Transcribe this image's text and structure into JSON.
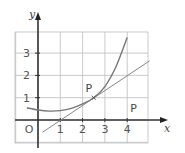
{
  "chart_data": {
    "type": "line",
    "title": "",
    "xlabel": "x",
    "ylabel": "y",
    "xlim": [
      -1,
      5
    ],
    "ylim": [
      -1,
      4
    ],
    "grid": true,
    "x_ticks": [
      "1",
      "2",
      "3",
      "4"
    ],
    "y_ticks": [
      "1",
      "2",
      "3"
    ],
    "origin_label": "O",
    "series": [
      {
        "name": "curve",
        "x": [
          -0.5,
          0,
          0.5,
          1,
          1.5,
          2,
          2.5,
          3,
          3.5,
          4
        ],
        "y": [
          0.55,
          0.45,
          0.4,
          0.42,
          0.52,
          0.72,
          1.0,
          1.5,
          2.4,
          3.7
        ]
      },
      {
        "name": "tangent",
        "x": [
          0.2,
          5.0
        ],
        "y": [
          -0.55,
          2.65
        ]
      }
    ],
    "annotations": [
      {
        "label": "P",
        "x": 2.5,
        "y": 1.0,
        "note": "point of tangency"
      },
      {
        "label": "P",
        "x": 4.2,
        "y": 0.35,
        "note": "label near x-axis"
      }
    ]
  }
}
